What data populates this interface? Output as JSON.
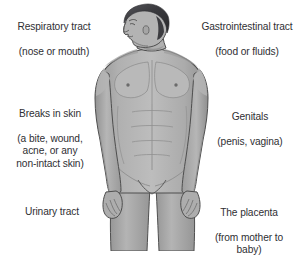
{
  "diagram": {
    "figure": {
      "name": "male-body-figure",
      "description": "Grayscale illustration of a shirtless male body, head shown in left profile, arms hanging at the sides, cropped at the thighs",
      "colors": {
        "background": "#ffffff",
        "skin_fill": "#a9a9a9",
        "skin_shadow": "#8f8f8f",
        "skin_highlight": "#c2c2c2",
        "outline": "#4a4a4a",
        "hair": "#3a3a3c",
        "text": "#2f2f33"
      }
    },
    "labels": {
      "respiratory": {
        "title": "Respiratory tract",
        "detail": "(nose or mouth)",
        "side": "left"
      },
      "breaks_in_skin": {
        "title": "Breaks in skin",
        "detail": "(a bite, wound,\nacne, or any\nnon-intact skin)",
        "side": "left"
      },
      "urinary": {
        "title": "Urinary tract",
        "detail": "",
        "side": "left"
      },
      "gastrointestinal": {
        "title": "Gastrointestinal tract",
        "detail": "(food or fluids)",
        "side": "right"
      },
      "genitals": {
        "title": "Genitals",
        "detail": "(penis, vagina)",
        "side": "right"
      },
      "placenta": {
        "title": "The placenta",
        "detail": "(from mother to\nbaby)",
        "side": "right"
      }
    }
  }
}
